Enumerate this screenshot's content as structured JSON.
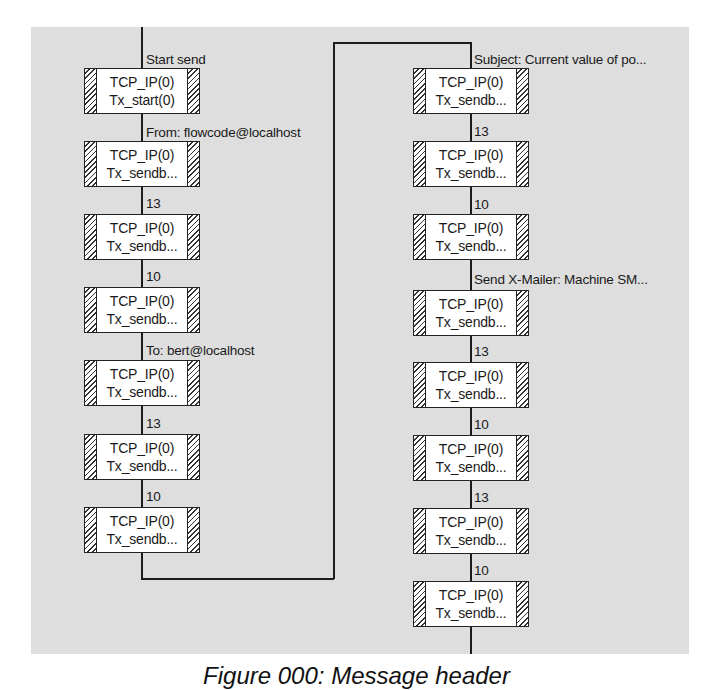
{
  "diagram": {
    "type": "flowchart",
    "left_column": {
      "blocks": [
        {
          "connector_label": "Start send",
          "component": "TCP_IP(0)",
          "macro": "Tx_start(0)"
        },
        {
          "connector_label": "From: flowcode@localhost",
          "component": "TCP_IP(0)",
          "macro": "Tx_sendb..."
        },
        {
          "connector_label": "13",
          "component": "TCP_IP(0)",
          "macro": "Tx_sendb..."
        },
        {
          "connector_label": "10",
          "component": "TCP_IP(0)",
          "macro": "Tx_sendb..."
        },
        {
          "connector_label": "To: bert@localhost",
          "component": "TCP_IP(0)",
          "macro": "Tx_sendb..."
        },
        {
          "connector_label": "13",
          "component": "TCP_IP(0)",
          "macro": "Tx_sendb..."
        },
        {
          "connector_label": "10",
          "component": "TCP_IP(0)",
          "macro": "Tx_sendb..."
        }
      ]
    },
    "right_column": {
      "blocks": [
        {
          "connector_label": "Subject: Current value of po...",
          "component": "TCP_IP(0)",
          "macro": "Tx_sendb..."
        },
        {
          "connector_label": "13",
          "component": "TCP_IP(0)",
          "macro": "Tx_sendb..."
        },
        {
          "connector_label": "10",
          "component": "TCP_IP(0)",
          "macro": "Tx_sendb..."
        },
        {
          "connector_label": "Send X-Mailer: Machine SM...",
          "component": "TCP_IP(0)",
          "macro": "Tx_sendb..."
        },
        {
          "connector_label": "13",
          "component": "TCP_IP(0)",
          "macro": "Tx_sendb..."
        },
        {
          "connector_label": "10",
          "component": "TCP_IP(0)",
          "macro": "Tx_sendb..."
        },
        {
          "connector_label": "13",
          "component": "TCP_IP(0)",
          "macro": "Tx_sendb..."
        },
        {
          "connector_label": "10",
          "component": "TCP_IP(0)",
          "macro": "Tx_sendb..."
        }
      ]
    }
  },
  "caption": "Figure 000: Message header"
}
